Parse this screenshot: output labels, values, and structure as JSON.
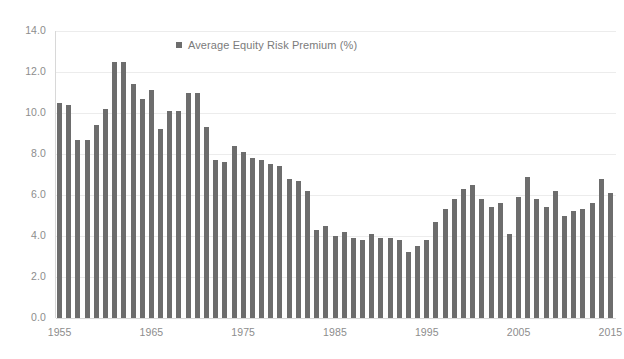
{
  "chart_data": {
    "type": "bar",
    "title": "",
    "subtitle": "",
    "xlabel": "",
    "ylabel": "",
    "ylim": [
      0.0,
      14.0
    ],
    "yticks": [
      "0.0",
      "2.0",
      "4.0",
      "6.0",
      "8.0",
      "10.0",
      "12.0",
      "14.0"
    ],
    "ytick_values": [
      0.0,
      2.0,
      4.0,
      6.0,
      8.0,
      10.0,
      12.0,
      14.0
    ],
    "xticks": [
      "1955",
      "1965",
      "1975",
      "1985",
      "1995",
      "2005",
      "2015"
    ],
    "xtick_values": [
      1955,
      1965,
      1975,
      1985,
      1995,
      2005,
      2015
    ],
    "grid": true,
    "legend_position": "top-center",
    "legend": [
      {
        "label": "Average Equity Risk Premium (%)",
        "color": "#6d6d6d",
        "marker": "square"
      }
    ],
    "series": [
      {
        "name": "Average Equity Risk Premium (%)",
        "color": "#6d6d6d",
        "categories": [
          1955,
          1956,
          1957,
          1958,
          1959,
          1960,
          1961,
          1962,
          1963,
          1964,
          1965,
          1966,
          1967,
          1968,
          1969,
          1970,
          1971,
          1972,
          1973,
          1974,
          1975,
          1976,
          1977,
          1978,
          1979,
          1980,
          1981,
          1982,
          1983,
          1984,
          1985,
          1986,
          1987,
          1988,
          1989,
          1990,
          1991,
          1992,
          1993,
          1994,
          1995,
          1996,
          1997,
          1998,
          1999,
          2000,
          2001,
          2002,
          2003,
          2004,
          2005,
          2006,
          2007,
          2008,
          2009,
          2010,
          2011,
          2012,
          2013,
          2014,
          2015
        ],
        "values": [
          10.5,
          10.4,
          8.7,
          8.7,
          9.4,
          10.2,
          12.5,
          12.5,
          11.4,
          10.7,
          11.1,
          9.2,
          10.1,
          10.1,
          11.0,
          11.0,
          9.3,
          7.7,
          7.6,
          8.4,
          8.1,
          7.8,
          7.7,
          7.5,
          7.4,
          6.8,
          6.7,
          6.2,
          4.3,
          4.5,
          4.0,
          4.2,
          3.9,
          3.8,
          4.1,
          3.9,
          3.9,
          3.8,
          3.2,
          3.5,
          3.8,
          4.7,
          5.3,
          5.8,
          6.3,
          6.5,
          5.8,
          5.4,
          5.6,
          4.1,
          5.9,
          6.9,
          5.8,
          5.4,
          6.2,
          5.0,
          5.2,
          5.3,
          5.6,
          6.8,
          6.1
        ]
      }
    ]
  }
}
